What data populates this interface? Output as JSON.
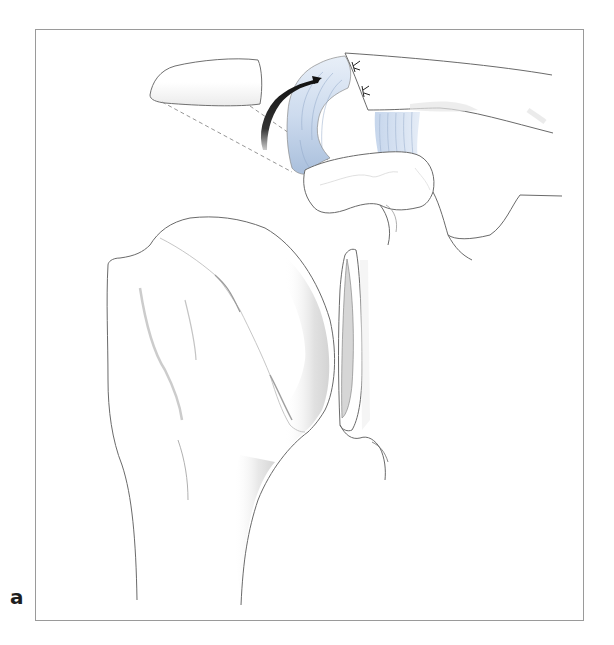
{
  "figure": {
    "panel_label": "a",
    "structures": [
      {
        "name": "resected-acromion-fragment",
        "shading": "light-gray"
      },
      {
        "name": "clavicle",
        "shading": "white"
      },
      {
        "name": "coracoacromial-ligament-transfer",
        "shading": "light-blue"
      },
      {
        "name": "coracoclavicular-ligament",
        "shading": "light-blue"
      },
      {
        "name": "coracoid-process",
        "shading": "white"
      },
      {
        "name": "humeral-head",
        "shading": "gray-gradient"
      },
      {
        "name": "glenoid",
        "shading": "gray"
      }
    ],
    "annotations": [
      {
        "type": "curved-arrow",
        "meaning": "ligament transfer direction"
      },
      {
        "type": "dashed-lines",
        "meaning": "resection projection",
        "count": 3
      },
      {
        "type": "suture-marks",
        "count": 2
      }
    ]
  },
  "colors": {
    "frame": "#9a9a9a",
    "outline": "#6a6a6a",
    "ligament_blue": "#c9d8ec",
    "ligament_blue_dark": "#a9bfdc",
    "bone_shade": "#d8d8d8",
    "arrow": "#1a1a1a",
    "label": "#1e1e1e"
  }
}
